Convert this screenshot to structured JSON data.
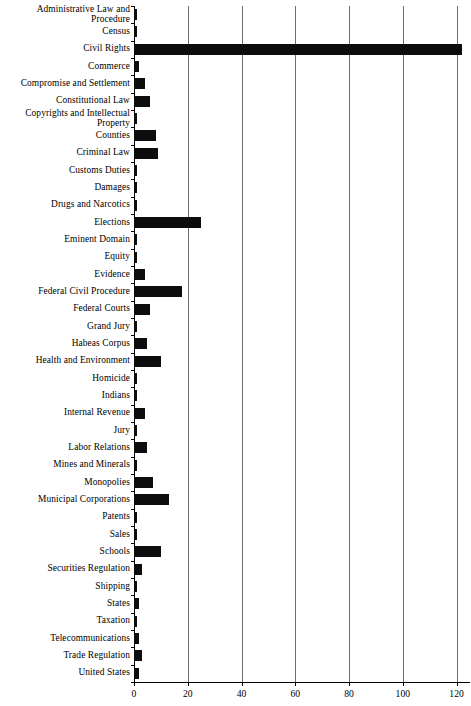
{
  "chart_data": {
    "type": "bar",
    "orientation": "horizontal",
    "title": "",
    "subtitle": "",
    "xlabel": "",
    "ylabel": "",
    "xlim": [
      0,
      125
    ],
    "ylim": null,
    "grid": true,
    "legend": null,
    "legend_position": "none",
    "bar_color": "#0d0d0d",
    "gridline_color": "#6d6d6d",
    "axis_color": "#000000",
    "background_color": "#ffffff",
    "xticks": [
      0,
      20,
      40,
      60,
      80,
      100,
      120
    ],
    "xtick_labels": [
      "0",
      "20",
      "40",
      "60",
      "80",
      "100",
      "120"
    ],
    "categories": [
      "Administrative Law and Procedure",
      "Census",
      "Civil Rights",
      "Commerce",
      "Compromise and Settlement",
      "Constitutional Law",
      "Copyrights and Intellectual Property",
      "Counties",
      "Criminal Law",
      "Customs Duties",
      "Damages",
      "Drugs and Narcotics",
      "Elections",
      "Eminent Domain",
      "Equity",
      "Evidence",
      "Federal Civil Procedure",
      "Federal Courts",
      "Grand Jury",
      "Habeas Corpus",
      "Health and Environment",
      "Homicide",
      "Indians",
      "Internal Revenue",
      "Jury",
      "Labor Relations",
      "Mines and Minerals",
      "Monopolies",
      "Municipal Corporations",
      "Patents",
      "Sales",
      "Schools",
      "Securities Regulation",
      "Shipping",
      "States",
      "Taxation",
      "Telecommunications",
      "Trade Regulation",
      "United States"
    ],
    "values": [
      1,
      1,
      122,
      2,
      4,
      6,
      1,
      8,
      9,
      1,
      1,
      1,
      25,
      1,
      1,
      4,
      18,
      6,
      1,
      5,
      10,
      1,
      1,
      4,
      1,
      5,
      1,
      7,
      13,
      1,
      1,
      10,
      3,
      1,
      2,
      1,
      2,
      3,
      2
    ]
  }
}
